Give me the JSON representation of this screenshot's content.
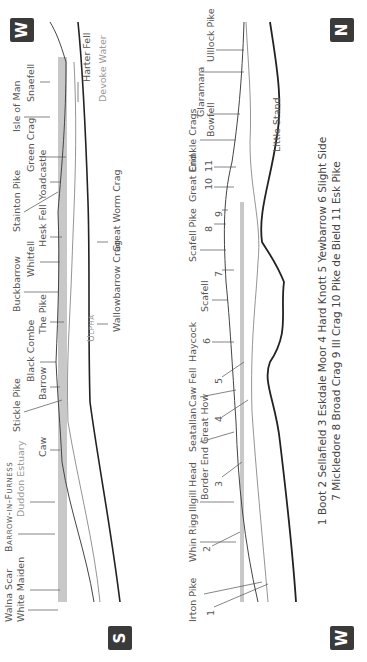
{
  "orientation": "rotated -90deg (panorama printed sideways)",
  "panorama_top": {
    "left_badge": "S",
    "right_badge": "W",
    "labels": [
      {
        "text": "Walna Scar",
        "x": 40,
        "y": 4
      },
      {
        "text": "White Maiden",
        "x": 40,
        "y": 16
      },
      {
        "text": "Barrow-in-Furness",
        "x": 110,
        "y": 4,
        "smallcaps": true
      },
      {
        "text": "Duddon Estuary",
        "x": 145,
        "y": 16,
        "light": true
      },
      {
        "text": "Caw",
        "x": 205,
        "y": 38
      },
      {
        "text": "Stickle Pike",
        "x": 230,
        "y": 12
      },
      {
        "text": "Barrow",
        "x": 262,
        "y": 38
      },
      {
        "text": "Black Combe",
        "x": 280,
        "y": 26
      },
      {
        "text": "The Pike",
        "x": 328,
        "y": 38
      },
      {
        "text": "Buckbarrow",
        "x": 350,
        "y": 12
      },
      {
        "text": "Whitfell",
        "x": 385,
        "y": 26
      },
      {
        "text": "Hesk Fell",
        "x": 415,
        "y": 38
      },
      {
        "text": "Stainton Pike",
        "x": 430,
        "y": 12
      },
      {
        "text": "Yoadcastle",
        "x": 462,
        "y": 38
      },
      {
        "text": "Green Crag",
        "x": 490,
        "y": 26
      },
      {
        "text": "Isle of Man",
        "x": 530,
        "y": 12
      },
      {
        "text": "Snaefell",
        "x": 560,
        "y": 26
      },
      {
        "text": "Ulpha",
        "x": 320,
        "y": 86,
        "smallcaps": true,
        "light": true
      },
      {
        "text": "Wallowbarrow Crag",
        "x": 330,
        "y": 112
      },
      {
        "text": "Great Worm Crag",
        "x": 410,
        "y": 112
      },
      {
        "text": "Devoke Water",
        "x": 560,
        "y": 98,
        "light": true
      },
      {
        "text": "Harter Fell",
        "x": 580,
        "y": 82
      }
    ]
  },
  "panorama_bottom": {
    "left_badge": "W",
    "right_badge": "N",
    "labels": [
      {
        "text": "Irton Pike",
        "x": 40,
        "y": 188
      },
      {
        "text": "1",
        "x": 46,
        "y": 206
      },
      {
        "text": "Whin Rigg",
        "x": 100,
        "y": 188
      },
      {
        "text": "2",
        "x": 110,
        "y": 202
      },
      {
        "text": "Illgill Head",
        "x": 150,
        "y": 188
      },
      {
        "text": "Border End",
        "x": 162,
        "y": 200
      },
      {
        "text": "3",
        "x": 175,
        "y": 214
      },
      {
        "text": "Seatallan",
        "x": 210,
        "y": 188
      },
      {
        "text": "Great How",
        "x": 218,
        "y": 200
      },
      {
        "text": "4",
        "x": 240,
        "y": 214
      },
      {
        "text": "Caw Fell",
        "x": 255,
        "y": 188
      },
      {
        "text": "5",
        "x": 278,
        "y": 214
      },
      {
        "text": "Haycock",
        "x": 300,
        "y": 188
      },
      {
        "text": "6",
        "x": 318,
        "y": 202
      },
      {
        "text": "Scafell",
        "x": 350,
        "y": 200
      },
      {
        "text": "7",
        "x": 385,
        "y": 214
      },
      {
        "text": "Scafell Pike",
        "x": 400,
        "y": 188
      },
      {
        "text": "8",
        "x": 430,
        "y": 204
      },
      {
        "text": "9",
        "x": 445,
        "y": 214
      },
      {
        "text": "Great End",
        "x": 460,
        "y": 188
      },
      {
        "text": "10",
        "x": 472,
        "y": 204
      },
      {
        "text": "11",
        "x": 490,
        "y": 204
      },
      {
        "text": "Crinkle Crags",
        "x": 490,
        "y": 188
      },
      {
        "text": "Bowfell",
        "x": 525,
        "y": 206
      },
      {
        "text": "Glaramara",
        "x": 545,
        "y": 196
      },
      {
        "text": "Ulllock Pike",
        "x": 600,
        "y": 206
      },
      {
        "text": "Little Stand",
        "x": 510,
        "y": 272
      }
    ]
  },
  "legend": {
    "line1": "1 Boot  2 Sellafield  3 Eskdale Moor  4 Hard Knott  5 Yewbarrow  6 Slight Side",
    "line2": "7 Mickledore  8 Broad Crag  9 Ill Crag  10 Pike de Bield  11 Esk Pike"
  },
  "colors": {
    "badge": "#3a3a3a",
    "sea": "#c8c8c8",
    "line": "#444444",
    "ink": "#555555"
  }
}
